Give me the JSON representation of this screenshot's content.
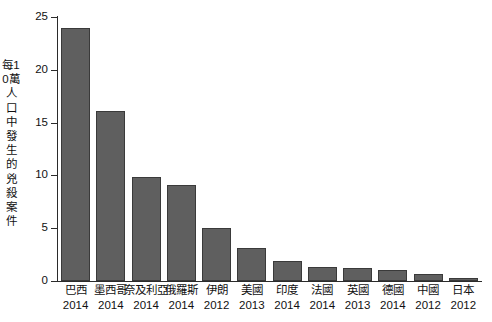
{
  "chart_data": {
    "type": "bar",
    "title": "",
    "subtitle": "",
    "xlabel": "",
    "ylabel": "每10萬人口中發生的兇殺案件",
    "ylim": [
      0,
      25
    ],
    "yticks": [
      0,
      5,
      10,
      15,
      20,
      25
    ],
    "ytick_labels": [
      "0",
      "5",
      "10",
      "15",
      "20",
      "25"
    ],
    "grid": false,
    "legend": null,
    "bar_color": "#5f5f5f",
    "bar_edge_color": "#3a3a3a",
    "axis_color": "#2b2b2b",
    "background_color": "#ffffff",
    "categories": [
      "巴西",
      "墨西哥",
      "奈及利亞",
      "俄羅斯",
      "伊朗",
      "美國",
      "印度",
      "法國",
      "英國",
      "德國",
      "中國",
      "日本"
    ],
    "years": [
      "2014",
      "2014",
      "2014",
      "2014",
      "2012",
      "2013",
      "2014",
      "2014",
      "2013",
      "2014",
      "2012",
      "2012"
    ],
    "values": [
      24.0,
      16.1,
      9.85,
      9.1,
      5.0,
      3.1,
      1.9,
      1.3,
      1.2,
      1.0,
      0.7,
      0.3
    ]
  }
}
